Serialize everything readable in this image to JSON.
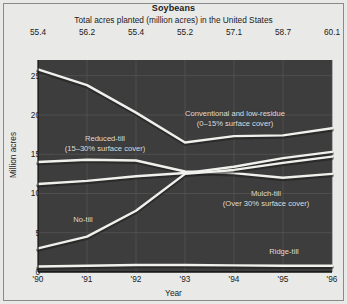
{
  "chart_data": {
    "type": "area",
    "title": "Soybeans",
    "subtitle": "Total acres planted (million acres) in the United States",
    "xlabel": "Year",
    "ylabel": "Million acres",
    "categories": [
      "'90",
      "'91",
      "'92",
      "'93",
      "'94",
      "'95",
      "'96"
    ],
    "x_raw": [
      1990,
      1991,
      1992,
      1993,
      1994,
      1995,
      1996
    ],
    "totals_label": "Total acres planted (million acres) in the United States",
    "totals": [
      "55.4",
      "56.2",
      "55.4",
      "55.2",
      "57.1",
      "58.7",
      "60.1"
    ],
    "totals_values": [
      55.4,
      56.2,
      55.4,
      55.2,
      57.1,
      58.7,
      60.1
    ],
    "ylim": [
      0,
      27
    ],
    "yticks": [
      0,
      5,
      10,
      15,
      20,
      25
    ],
    "ytick_labels": [
      "0",
      "5",
      "10",
      "15",
      "20",
      "25"
    ],
    "xlim": [
      1990,
      1996
    ],
    "grid": true,
    "legend": "inline-annotations",
    "stacked": false,
    "series": [
      {
        "name": "Conventional and low-residue (0-15% surface cover)",
        "short_name": "Conventional and low-residue",
        "values": [
          25.8,
          23.8,
          20.3,
          16.5,
          17.3,
          17.4,
          18.3
        ]
      },
      {
        "name": "Reduced-till (15-30% surface cover)",
        "short_name": "Reduced-till",
        "values": [
          14.0,
          14.3,
          14.2,
          12.8,
          12.6,
          12.0,
          12.5
        ]
      },
      {
        "name": "Mulch-till (Over 30% surface cover)",
        "short_name": "Mulch-till",
        "values": [
          11.2,
          11.6,
          12.2,
          12.6,
          13.4,
          14.5,
          15.3
        ]
      },
      {
        "name": "No-till",
        "short_name": "No-till",
        "values": [
          3.0,
          4.5,
          7.8,
          12.5,
          13.0,
          13.9,
          14.7
        ]
      },
      {
        "name": "Ridge-till",
        "short_name": "Ridge-till",
        "values": [
          0.7,
          0.8,
          0.9,
          0.9,
          0.85,
          0.8,
          0.8
        ]
      }
    ],
    "annotations": [
      {
        "id": "conventional",
        "line1": "Conventional and low-residue",
        "line2": "(0–15% surface cover)",
        "x": 235,
        "y": 118
      },
      {
        "id": "reduced-till",
        "line1": "Reduced-till",
        "line2": "(15–30% surface cover)",
        "x": 105,
        "y": 143
      },
      {
        "id": "mulch-till",
        "line1": "Mulch-till",
        "line2": "(Over 30% surface cover)",
        "x": 266,
        "y": 198
      },
      {
        "id": "no-till",
        "line1": "No-till",
        "line2": "",
        "x": 83,
        "y": 220
      },
      {
        "id": "ridge-till",
        "line1": "Ridge-till",
        "line2": "",
        "x": 284,
        "y": 252
      }
    ],
    "colors": {
      "plot_background": "#3d3d3d",
      "page_background": "#e9e9e7",
      "line": "#f0f0ec",
      "grid": "#545454",
      "text": "#1b1b1b",
      "annotation_text": "#e2e2e2",
      "border": "#8a8a8a"
    }
  }
}
